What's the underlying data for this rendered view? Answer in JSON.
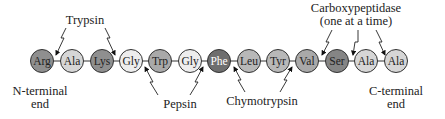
{
  "diagram": {
    "residues": [
      {
        "name": "Arg",
        "fill": "#8f8f8f",
        "text": "#222222",
        "cx": 42
      },
      {
        "name": "Ala",
        "fill": "#d6d6d6",
        "text": "#222222",
        "cx": 72
      },
      {
        "name": "Lys",
        "fill": "#8f8f8f",
        "text": "#222222",
        "cx": 102
      },
      {
        "name": "Gly",
        "fill": "#ededed",
        "text": "#222222",
        "cx": 131
      },
      {
        "name": "Trp",
        "fill": "#a9a9a9",
        "text": "#222222",
        "cx": 160
      },
      {
        "name": "Gly",
        "fill": "#ededed",
        "text": "#222222",
        "cx": 190
      },
      {
        "name": "Phe",
        "fill": "#6e6e6e",
        "text": "#ffffff",
        "cx": 219
      },
      {
        "name": "Leu",
        "fill": "#b8b8b8",
        "text": "#222222",
        "cx": 249
      },
      {
        "name": "Tyr",
        "fill": "#b8b8b8",
        "text": "#222222",
        "cx": 278
      },
      {
        "name": "Val",
        "fill": "#a9a9a9",
        "text": "#222222",
        "cx": 307
      },
      {
        "name": "Ser",
        "fill": "#858585",
        "text": "#222222",
        "cx": 337
      },
      {
        "name": "Ala",
        "fill": "#d6d6d6",
        "text": "#222222",
        "cx": 366
      },
      {
        "name": "Ala",
        "fill": "#d6d6d6",
        "text": "#222222",
        "cx": 396
      }
    ],
    "enzymes": {
      "trypsin": "Trypsin",
      "pepsin": "Pepsin",
      "chymotrypsin": "Chymotrypsin",
      "carboxypeptidase_line1": "Carboxypeptidase",
      "carboxypeptidase_line2": "(one at a time)"
    },
    "ends": {
      "n_terminal_line1": "N-terminal",
      "n_terminal_line2": "end",
      "c_terminal_line1": "C-terminal",
      "c_terminal_line2": "end"
    }
  }
}
